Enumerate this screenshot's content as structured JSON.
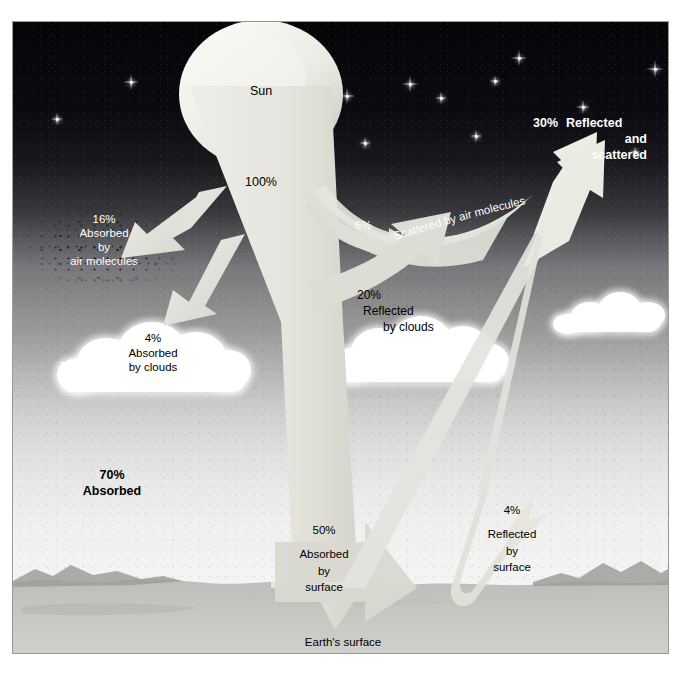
{
  "figure": {
    "colors": {
      "sky_top": "#050508",
      "sky_mid": "#8a8a8a",
      "sky_bottom": "#f3f3f3",
      "beam": "#e9e9e4",
      "beam_shadow": "#c9c9c4",
      "ground": "#b9b9b4",
      "cloud": "#ffffff",
      "text_dark": "#000000",
      "text_light": "#ffffff",
      "frame": "#9a9a9a"
    }
  },
  "labels": {
    "sun": "Sun",
    "incoming": "100%",
    "absorbed_air": {
      "pct": "16%",
      "line1": "Absorbed",
      "line2": "by",
      "line3": "air molecules"
    },
    "absorbed_clouds": {
      "pct": "4%",
      "line1": "Absorbed",
      "line2": "by clouds"
    },
    "scattered_air": {
      "pct": "6%",
      "text": "Scattered by air molecules"
    },
    "reflected_clouds": {
      "pct": "20%",
      "line1": "Reflected",
      "line2": "by clouds"
    },
    "reflected_scattered": {
      "pct": "30%",
      "line1": "Reflected",
      "line2": "and",
      "line3": "scattered"
    },
    "absorbed_total": {
      "pct": "70%",
      "line1": "Absorbed"
    },
    "absorbed_surface": {
      "pct": "50%",
      "line1": "Absorbed",
      "line2": "by",
      "line3": "surface"
    },
    "reflected_surface": {
      "pct": "4%",
      "line1": "Reflected",
      "line2": "by",
      "line3": "surface"
    },
    "earth_surface": "Earth's surface"
  },
  "chart_data": {
    "type": "diagram",
    "total_incoming_percent": 100,
    "components": [
      {
        "name": "Absorbed by air molecules",
        "percent": 16,
        "category": "absorbed"
      },
      {
        "name": "Absorbed by clouds",
        "percent": 4,
        "category": "absorbed"
      },
      {
        "name": "Absorbed by surface",
        "percent": 50,
        "category": "absorbed"
      },
      {
        "name": "Scattered by air molecules",
        "percent": 6,
        "category": "reflected"
      },
      {
        "name": "Reflected by clouds",
        "percent": 20,
        "category": "reflected"
      },
      {
        "name": "Reflected by surface",
        "percent": 4,
        "category": "reflected"
      }
    ],
    "totals": [
      {
        "name": "Absorbed",
        "percent": 70
      },
      {
        "name": "Reflected and scattered",
        "percent": 30
      }
    ]
  },
  "stars": [
    {
      "x": 44,
      "y": 97,
      "s": 13
    },
    {
      "x": 118,
      "y": 60,
      "s": 17
    },
    {
      "x": 279,
      "y": 33,
      "s": 15
    },
    {
      "x": 334,
      "y": 74,
      "s": 17
    },
    {
      "x": 428,
      "y": 76,
      "s": 13
    },
    {
      "x": 463,
      "y": 114,
      "s": 13
    },
    {
      "x": 482,
      "y": 59,
      "s": 11
    },
    {
      "x": 397,
      "y": 62,
      "s": 18
    },
    {
      "x": 506,
      "y": 36,
      "s": 17
    },
    {
      "x": 570,
      "y": 85,
      "s": 15
    },
    {
      "x": 642,
      "y": 47,
      "s": 19
    },
    {
      "x": 622,
      "y": 130,
      "s": 11
    },
    {
      "x": 352,
      "y": 121,
      "s": 12
    },
    {
      "x": 247,
      "y": 49,
      "s": 11
    }
  ]
}
